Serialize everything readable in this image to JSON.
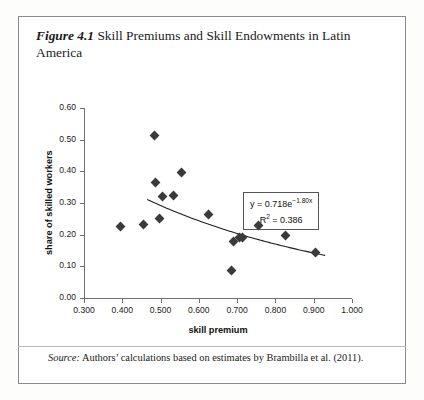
{
  "figure": {
    "number": "Figure 4.1",
    "title": "Skill Premiums and Skill Endowments in Latin America"
  },
  "source": {
    "lead": "Source:",
    "text": " Authors’ calculations based on estimates by Brambilla et al. (2011)."
  },
  "equation": {
    "line1_prefix": "y = 0.718e",
    "line1_exponent": "−1.80x",
    "line2_prefix": "R",
    "line2_sup": "2",
    "line2_value": " = 0.386"
  },
  "chart_data": {
    "type": "scatter",
    "title": "Skill Premiums and Skill Endowments in Latin America",
    "xlabel": "skill premium",
    "ylabel": "share of skilled workers",
    "xlim": [
      0.3,
      1.0
    ],
    "ylim": [
      0.0,
      0.6
    ],
    "xticks": [
      "0.300",
      "0.400",
      "0.500",
      "0.600",
      "0.700",
      "0.800",
      "0.900",
      "1.000"
    ],
    "xtick_values": [
      0.3,
      0.4,
      0.5,
      0.6,
      0.7,
      0.8,
      0.9,
      1.0
    ],
    "yticks": [
      "0.00",
      "0.10",
      "0.20",
      "0.30",
      "0.40",
      "0.50",
      "0.60"
    ],
    "ytick_values": [
      0.0,
      0.1,
      0.2,
      0.3,
      0.4,
      0.5,
      0.6
    ],
    "grid": false,
    "legend": false,
    "marker": "diamond",
    "marker_color": "#3a3a3a",
    "points": [
      {
        "x": 0.395,
        "y": 0.225
      },
      {
        "x": 0.455,
        "y": 0.232
      },
      {
        "x": 0.485,
        "y": 0.513
      },
      {
        "x": 0.487,
        "y": 0.365
      },
      {
        "x": 0.497,
        "y": 0.252
      },
      {
        "x": 0.505,
        "y": 0.322
      },
      {
        "x": 0.533,
        "y": 0.325
      },
      {
        "x": 0.555,
        "y": 0.395
      },
      {
        "x": 0.625,
        "y": 0.265
      },
      {
        "x": 0.685,
        "y": 0.088
      },
      {
        "x": 0.69,
        "y": 0.178
      },
      {
        "x": 0.705,
        "y": 0.192
      },
      {
        "x": 0.715,
        "y": 0.19
      },
      {
        "x": 0.755,
        "y": 0.228
      },
      {
        "x": 0.825,
        "y": 0.198
      },
      {
        "x": 0.905,
        "y": 0.143
      }
    ],
    "trendline": {
      "type": "exponential",
      "equation": "y = 0.718e^(-1.80x)",
      "coefficient": 0.718,
      "exponent": -1.8,
      "r_squared": 0.386,
      "x_start": 0.465,
      "x_end": 0.93,
      "color": "#1f1f1f"
    }
  }
}
